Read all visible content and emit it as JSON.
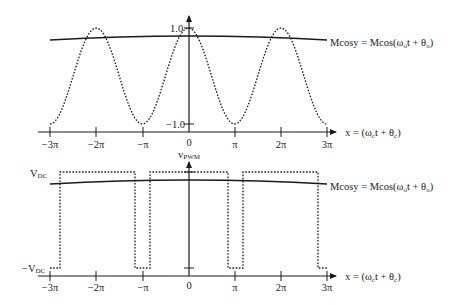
{
  "chart_data": [
    {
      "type": "line",
      "title": "Carrier cosine and modulating signal",
      "xlabel": "x = (ωct + θc)",
      "ylabel": "",
      "x_ticks": [
        "−3π",
        "−2π",
        "−π",
        "0",
        "π",
        "2π",
        "3π"
      ],
      "y_ticks": [
        "1.0",
        "−1.0"
      ],
      "ylim": [
        -1.0,
        1.0
      ],
      "series": [
        {
          "name": "carrier cos x",
          "style": "dotted",
          "function": "cos(x)",
          "x_range": [
            "-3π",
            "3π"
          ]
        },
        {
          "name": "Mcosy = Mcos(ωot + θo)",
          "style": "solid",
          "description": "slowly varying modulating signal, approx 0.85 with slight curvature"
        }
      ],
      "annotation": "Mcosy = Mcos(ωot + θo)"
    },
    {
      "type": "line",
      "title": "vPWM",
      "xlabel": "x = (ωct + θc)",
      "ylabel": "vPWM",
      "x_ticks": [
        "−3π",
        "−2π",
        "−π",
        "0",
        "π",
        "2π",
        "3π"
      ],
      "y_levels": [
        "VDC",
        "−VDC"
      ],
      "series": [
        {
          "name": "vPWM",
          "style": "dotted",
          "levels": [
            "VDC",
            "−VDC"
          ],
          "transitions_x": [
            "≈-2.8π",
            "≈-1.2π",
            "≈-0.85π",
            "≈0.85π",
            "≈1.2π",
            "≈2.8π"
          ]
        },
        {
          "name": "Mcosy = Mcos(ωot + θo)",
          "style": "solid"
        }
      ],
      "annotation": "Mcosy = Mcos(ωot + θo)"
    }
  ],
  "top": {
    "y_tick_top": "1.0",
    "y_tick_bottom": "−1.0",
    "x_ticks": [
      "−3π",
      "−2π",
      "−π",
      "0",
      "π",
      "2π",
      "3π"
    ],
    "m_label_main": "Mcosy = Mcos(ω",
    "m_label_sub": "o",
    "m_label_mid": "t + θ",
    "m_label_sub2": "o",
    "m_label_end": ")",
    "x_label_main": "x = (ω",
    "x_label_sub": "c",
    "x_label_mid": "t + θ",
    "x_label_sub2": "c",
    "x_label_end": ")"
  },
  "bottom": {
    "y_axis_label_main": "v",
    "y_axis_label_sub": "PWM",
    "vdc_main": "V",
    "vdc_sub": "DC",
    "neg_vdc_main": "−V",
    "neg_vdc_sub": "DC",
    "x_ticks": [
      "−3π",
      "−2π",
      "−π",
      "0",
      "π",
      "2π",
      "3π"
    ],
    "m_label_main": "Mcosy = Mcos(ω",
    "m_label_sub": "o",
    "m_label_mid": "t + θ",
    "m_label_sub2": "o",
    "m_label_end": ")",
    "x_label_main": "x = (ω",
    "x_label_sub": "c",
    "x_label_mid": "t + θ",
    "x_label_sub2": "c",
    "x_label_end": ")"
  }
}
